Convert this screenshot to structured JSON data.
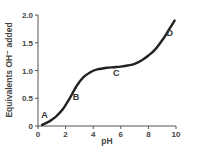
{
  "chart_data": {
    "type": "line",
    "title": "",
    "xlabel": "pH",
    "ylabel": "Equivalents OH⁻ added",
    "xlim": [
      0,
      10
    ],
    "ylim": [
      0,
      2.0
    ],
    "grid": false,
    "legend": null,
    "x_ticks": [
      "0",
      "2",
      "4",
      "6",
      "8",
      "10"
    ],
    "y_ticks": [
      "0",
      "0.5",
      "1.0",
      "1.5",
      "2.0"
    ],
    "series": [
      {
        "name": "titration curve",
        "x": [
          0.3,
          0.8,
          1.3,
          1.8,
          2.3,
          2.8,
          3.3,
          3.8,
          4.3,
          5.0,
          5.5,
          6.0,
          6.5,
          7.0,
          7.5,
          8.0,
          8.5,
          9.1,
          9.5,
          9.9
        ],
        "y": [
          0.02,
          0.08,
          0.17,
          0.3,
          0.5,
          0.72,
          0.88,
          0.97,
          1.02,
          1.05,
          1.06,
          1.07,
          1.09,
          1.12,
          1.18,
          1.27,
          1.38,
          1.58,
          1.74,
          1.9
        ]
      }
    ],
    "annotations": [
      {
        "label": "A",
        "x": 0.3,
        "y": 0.02
      },
      {
        "label": "B",
        "x": 2.3,
        "y": 0.5
      },
      {
        "label": "C",
        "x": 5.5,
        "y": 1.06
      },
      {
        "label": "D",
        "x": 9.1,
        "y": 1.58
      }
    ]
  }
}
